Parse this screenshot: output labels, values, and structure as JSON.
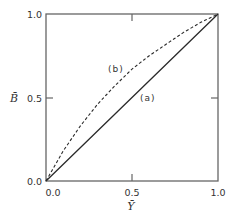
{
  "chart_data": {
    "type": "line",
    "title": "",
    "xlabel": "Ȳ",
    "ylabel": "B̄",
    "xlim": [
      0.0,
      1.0
    ],
    "ylim": [
      0.0,
      1.0
    ],
    "grid": false,
    "legend": "none (inline curve labels)",
    "x_ticks": [
      "0.0",
      "0.5",
      "1.0"
    ],
    "y_ticks": [
      "0.0",
      "0.5",
      "1.0"
    ],
    "series": [
      {
        "name": "(a)",
        "style": "solid",
        "x": [
          0.0,
          0.25,
          0.5,
          0.75,
          1.0
        ],
        "y": [
          0.0,
          0.25,
          0.5,
          0.75,
          1.0
        ]
      },
      {
        "name": "(b)",
        "style": "dashed",
        "x": [
          0.0,
          0.1,
          0.2,
          0.3,
          0.4,
          0.5,
          0.6,
          0.7,
          0.8,
          0.9,
          1.0
        ],
        "y": [
          0.0,
          0.18,
          0.33,
          0.46,
          0.57,
          0.67,
          0.75,
          0.82,
          0.89,
          0.95,
          1.0
        ]
      }
    ],
    "annotations": [
      {
        "text": "(a)",
        "x": 0.56,
        "y": 0.5
      },
      {
        "text": "(b)",
        "x": 0.38,
        "y": 0.67
      }
    ]
  },
  "labels": {
    "x_axis": "Ȳ",
    "y_axis": "B̄",
    "x_tick_0": "0.0",
    "x_tick_1": "0.5",
    "x_tick_2": "1.0",
    "y_tick_0": "0.0",
    "y_tick_1": "0.5",
    "y_tick_2": "1.0",
    "curve_a": "(a)",
    "curve_b": "(b)"
  },
  "colors": {
    "axis": "#555555",
    "line": "#2a2a2a"
  }
}
